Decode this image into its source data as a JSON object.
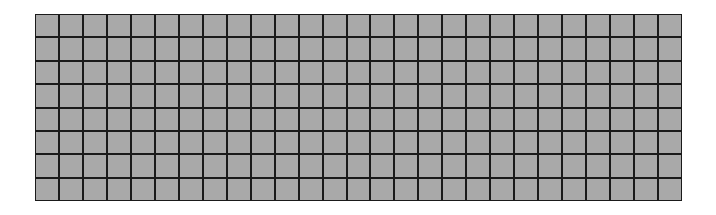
{
  "grid": {
    "rows": 8,
    "columns": 27,
    "cell_color": "#a9a9a9",
    "line_color": "#1a1a1a",
    "background": "#ffffff"
  }
}
